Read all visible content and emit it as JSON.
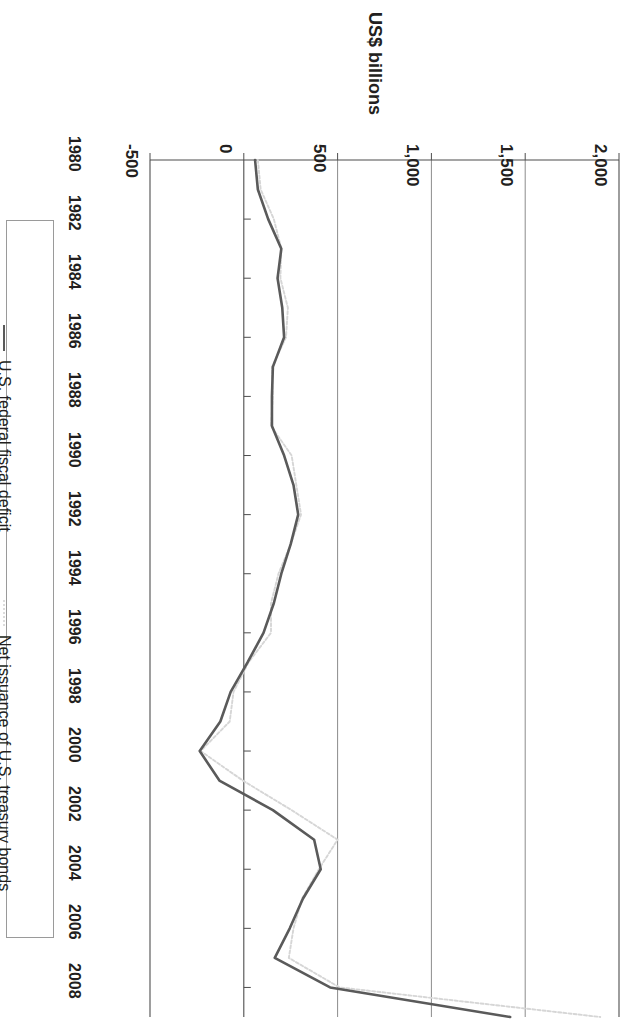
{
  "chart_data": {
    "type": "line",
    "title": "",
    "xlabel": "",
    "ylabel": "US$ billions",
    "grid": true,
    "legend_position": "right",
    "orientation": "rotated-180",
    "x": [
      1980,
      1981,
      1982,
      1983,
      1984,
      1985,
      1986,
      1987,
      1988,
      1989,
      1990,
      1991,
      1992,
      1993,
      1994,
      1995,
      1996,
      1997,
      1998,
      1999,
      2000,
      2001,
      2002,
      2003,
      2004,
      2005,
      2006,
      2007,
      2008,
      2009
    ],
    "x_tick_labels": [
      "1980",
      "1982",
      "1984",
      "1986",
      "1988",
      "1990",
      "1992",
      "1994",
      "1996",
      "1998",
      "2000",
      "2002",
      "2004",
      "2006",
      "2008"
    ],
    "y_tick_labels": [
      "2,000",
      "1,500",
      "1,000",
      "500",
      "0",
      "-500"
    ],
    "y_ticks": [
      2000,
      1500,
      1000,
      500,
      0,
      -500
    ],
    "ylim": [
      -500,
      2000
    ],
    "series": [
      {
        "name": "U.S. federal fiscal deficit",
        "style": "solid",
        "color": "#5a5a5a",
        "values": [
          60,
          75,
          130,
          200,
          180,
          205,
          215,
          155,
          150,
          150,
          215,
          265,
          290,
          250,
          200,
          160,
          105,
          20,
          -70,
          -125,
          -235,
          -130,
          155,
          375,
          410,
          315,
          245,
          165,
          460,
          1420
        ]
      },
      {
        "name": "Net issuance of U.S. treasury bonds",
        "style": "dotted",
        "color": "#d6d6d6",
        "values": [
          75,
          90,
          160,
          200,
          195,
          235,
          225,
          150,
          155,
          145,
          255,
          280,
          305,
          250,
          185,
          145,
          145,
          25,
          -55,
          -75,
          -230,
          -5,
          255,
          500,
          400,
          310,
          265,
          240,
          510,
          1900
        ]
      }
    ]
  },
  "axis": {
    "value_axis_title": "US$ billions"
  },
  "legend": {
    "entries": [
      {
        "label": "U.S. federal fiscal deficit",
        "style": "solid"
      },
      {
        "label": "Net issuance of U.S. treasury bonds",
        "style": "dotted"
      }
    ]
  }
}
